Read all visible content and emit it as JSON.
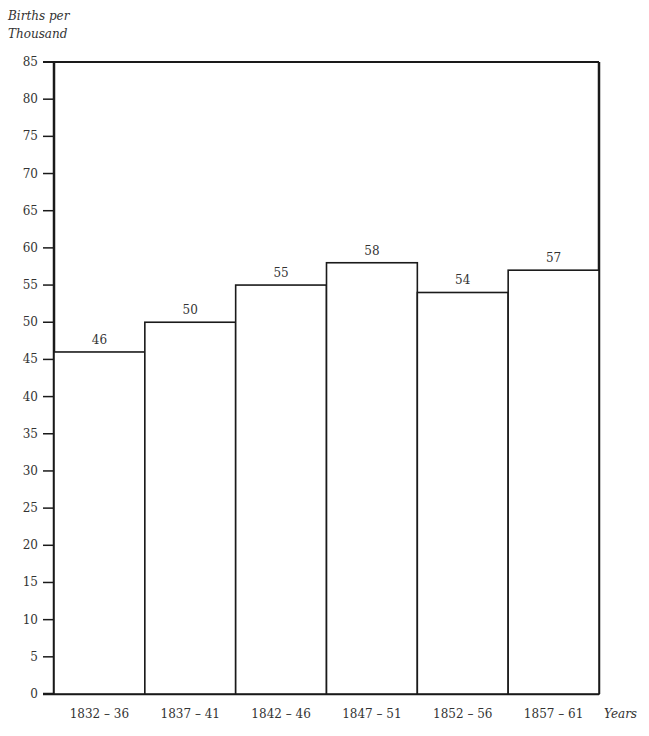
{
  "chart_data": {
    "type": "bar",
    "title": "",
    "ylabel": "Births per Thousand",
    "xlabel": "Years",
    "categories": [
      "1832-36",
      "1837-41",
      "1842-46",
      "1847-51",
      "1852-56",
      "1857-61"
    ],
    "category_labels": [
      "1832 – 36",
      "1837 – 41",
      "1842 – 46",
      "1847 – 51",
      "1852 – 56",
      "1857 – 61"
    ],
    "values": [
      46,
      50,
      55,
      58,
      54,
      57
    ],
    "value_labels": [
      "46",
      "50",
      "55",
      "58",
      "54",
      "57"
    ],
    "ylim": [
      0,
      85
    ],
    "yticks": [
      0,
      5,
      10,
      15,
      20,
      25,
      30,
      35,
      40,
      45,
      50,
      55,
      60,
      65,
      70,
      75,
      80,
      85
    ],
    "grid": false,
    "legend": null,
    "bar_style": "outlined histogram, no gaps, black strokes on white"
  },
  "axis": {
    "ylabel_line1": "Births per",
    "ylabel_line2": "Thousand",
    "xunit": "Years"
  },
  "colors": {
    "stroke": "#1a1a1a",
    "fill": "#ffffff",
    "text": "#333333"
  }
}
